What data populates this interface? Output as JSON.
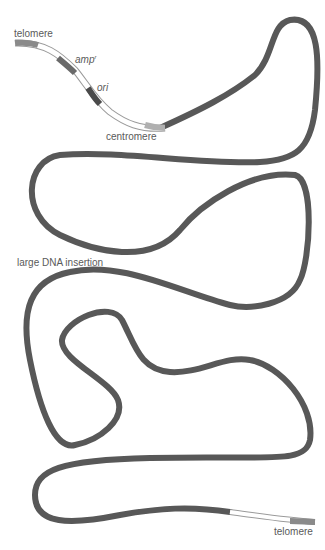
{
  "diagram": {
    "labels": {
      "telomere_top": "telomere",
      "amp": "amp",
      "amp_sup": "r",
      "ori": "ori",
      "centromere": "centromere",
      "insertion": "large DNA insertion",
      "telomere_bottom": "telomere"
    },
    "colors": {
      "insert_strand": "#585858",
      "telomere": "#8a8a8a",
      "amp_marker": "#6a6a6a",
      "ori_marker": "#4a4a4a",
      "centromere": "#b0b0b0",
      "vector_backbone": "#ffffff",
      "outline": "#9a9a9a",
      "label": "#5a5a5a"
    }
  }
}
